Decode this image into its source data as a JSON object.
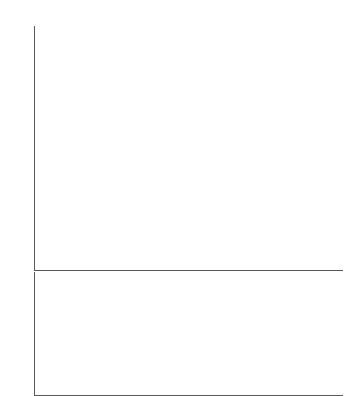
{
  "colors": {
    "bar": "#0d0d0d",
    "axis": "#58595b",
    "title": "#6d6e71",
    "label": "#414042",
    "background": "#ffffff"
  },
  "chart_data": [
    {
      "type": "bar",
      "id": "top-chart",
      "title": "OR CONGRESSES IN EARLY 2015",
      "xlabel": "",
      "ylabel": "",
      "ylim": [
        0,
        100
      ],
      "ytick_step": 10,
      "minor_tick_step": 2,
      "grid": false,
      "legend": "none",
      "value_suffix": "%",
      "ytick_labels": [
        "10%",
        "20%",
        "30%",
        "40%",
        "50%",
        "60%",
        "70%",
        "80%",
        "90%",
        "100%"
      ],
      "categories": [
        "Rwanda",
        "Bolivia",
        "Andorra",
        "Cuba",
        "Seychelles",
        "Sweden",
        "Senegal",
        "Finland",
        "Ecuador",
        "South Africa",
        "Iceland",
        "Spain"
      ],
      "values": [
        63.8,
        53.1,
        50,
        48.9,
        43.8,
        43.6,
        42.7,
        42.5,
        41.6,
        41.5,
        41.3,
        41.1
      ],
      "value_labels": [
        "63.8%",
        "53.1%",
        "50%",
        "48.9%",
        "43.8%",
        "43.6%",
        "42.7%",
        "42.5%",
        "41.6%",
        "41.5%",
        "41.3%",
        "41.1%"
      ]
    },
    {
      "type": "bar",
      "id": "bottom-chart",
      "title": "",
      "xlabel": "",
      "ylabel": "",
      "ylim": [
        0,
        10
      ],
      "ytick_step": 5,
      "minor_tick_step": 1,
      "grid": false,
      "legend": "none",
      "value_suffix": "%",
      "ytick_labels": [
        "5%",
        "10%"
      ],
      "categories": [
        "Comoros",
        "Marshall Islands",
        "Papua New Guinea",
        "Solomon Islands",
        "Kuwait",
        "Oman",
        "Yemen",
        "Micronesia",
        "Palau",
        "Qatar",
        "Tonga",
        "Vanuatu"
      ],
      "values": [
        3,
        3,
        2.7,
        2,
        1.5,
        1.2,
        0.3,
        0,
        0,
        0,
        0,
        0
      ],
      "value_labels": [
        "3%",
        "3%",
        "2.7%",
        "2%",
        "1.5%",
        "1.2%",
        "0.3%",
        "0%",
        "0%",
        "0%",
        "0%",
        "0%"
      ]
    }
  ]
}
